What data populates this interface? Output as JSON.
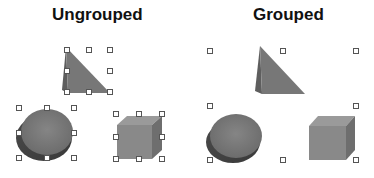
{
  "panels": {
    "ungrouped": {
      "title": "Ungrouped"
    },
    "grouped": {
      "title": "Grouped"
    }
  },
  "colors": {
    "shape_dark": "#555555",
    "shape_mid": "#7a7a7a",
    "shape_light": "#959595",
    "handle_stroke": "#555555",
    "handle_fill": "#ffffff",
    "title": "#111111"
  },
  "shapes": [
    "pyramid",
    "cylinder",
    "cube"
  ],
  "selection_handles": {
    "ungrouped_pyramid": {
      "x": [
        67,
        89,
        110
      ],
      "y": [
        50,
        71,
        92
      ]
    },
    "ungrouped_cylinder": {
      "x": [
        19,
        47,
        74
      ],
      "y": [
        108,
        133,
        158
      ]
    },
    "ungrouped_cube": {
      "x": [
        116,
        139,
        162
      ],
      "y": [
        114,
        137,
        159
      ]
    },
    "grouped_all": {
      "x": [
        210,
        283,
        356
      ],
      "y": [
        51,
        106,
        160
      ]
    }
  }
}
